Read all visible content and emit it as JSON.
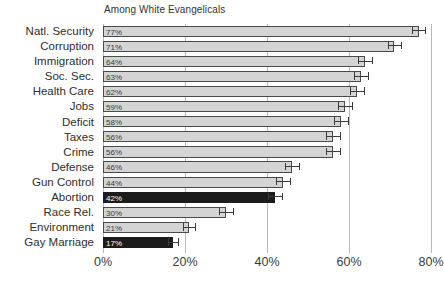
{
  "chart_data": {
    "type": "bar",
    "orientation": "horizontal",
    "title": "Among White Evangelicals",
    "xlabel": "",
    "ylabel": "",
    "xlim": [
      0,
      80
    ],
    "grid": true,
    "legend": false,
    "xticks": [
      0,
      20,
      40,
      60,
      80
    ],
    "xtick_labels": [
      "0%",
      "20%",
      "40%",
      "60%",
      "80%"
    ],
    "categories": [
      "Natl. Security",
      "Corruption",
      "Immigration",
      "Soc. Sec.",
      "Health Care",
      "Jobs",
      "Deficit",
      "Taxes",
      "Crime",
      "Defense",
      "Gun Control",
      "Abortion",
      "Race Rel.",
      "Environment",
      "Gay Marriage"
    ],
    "values": [
      77,
      71,
      64,
      63,
      62,
      59,
      58,
      56,
      56,
      46,
      44,
      42,
      30,
      21,
      17
    ],
    "value_labels": [
      "77%",
      "71%",
      "64%",
      "63%",
      "62%",
      "59%",
      "58%",
      "56%",
      "56%",
      "46%",
      "44%",
      "42%",
      "30%",
      "21%",
      "17%"
    ],
    "errors": [
      1.6,
      1.6,
      1.7,
      1.7,
      1.7,
      1.7,
      1.7,
      1.7,
      1.7,
      1.7,
      1.7,
      1.7,
      1.6,
      1.4,
      1.2
    ],
    "highlighted": [
      false,
      false,
      false,
      false,
      false,
      false,
      false,
      false,
      false,
      false,
      false,
      true,
      false,
      false,
      true
    ],
    "colors": {
      "bar_fill": "#d4d4d4",
      "bar_edge": "#4a4a4a",
      "bar_highlight": "#1c1c1c",
      "grid": "#b9b9b9",
      "text": "#2e2e2e",
      "value_label": "#3a3a3a",
      "value_label_highlight": "#ffffff",
      "background": "#ffffff"
    }
  }
}
